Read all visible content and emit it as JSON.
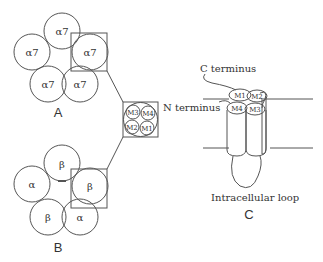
{
  "panels": {
    "A": {
      "label": "A",
      "subunits": [
        "α7",
        "α7",
        "α7",
        "α7",
        "α7"
      ]
    },
    "B": {
      "label": "B",
      "subunits": [
        "β",
        "α",
        "β",
        "β",
        "α"
      ]
    },
    "center": {
      "segments": [
        "M3",
        "M4",
        "M2",
        "M1"
      ]
    },
    "C": {
      "label": "C",
      "c_terminus": "C terminus",
      "n_terminus": "N terminus",
      "intracellular_loop": "Intracellular loop",
      "top_helices": [
        "M1",
        "M2",
        "M4",
        "M3"
      ]
    }
  },
  "colors": {
    "stroke": "#555555",
    "text": "#333333",
    "background": "#ffffff"
  }
}
